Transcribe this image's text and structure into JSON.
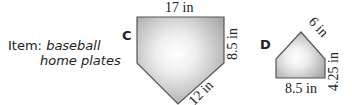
{
  "caption": {
    "label": "Item:",
    "item_line1": "baseball",
    "item_line2": "home plates"
  },
  "figures": [
    {
      "id": "C",
      "letter": "C",
      "shape": "pentagon (home plate)",
      "dimensions": {
        "top": "17 in",
        "right_side": "8.5 in",
        "diagonal": "12 in"
      }
    },
    {
      "id": "D",
      "letter": "D",
      "shape": "pentagon (home plate, inverted)",
      "dimensions": {
        "diagonal": "6 in",
        "right_side": "4.25 in",
        "bottom": "8.5 in"
      }
    }
  ],
  "colors": {
    "fill_center": "#ffffff",
    "fill_edge": "#a8a8a8",
    "stroke": "#555555",
    "text": "#222222"
  }
}
